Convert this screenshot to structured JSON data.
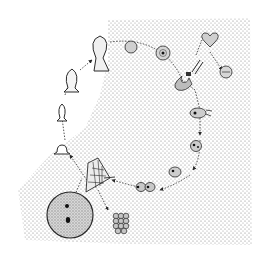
{
  "figure": {
    "type": "life-cycle illustration",
    "style": "stippled pen-and-ink",
    "colors": {
      "background": "#ffffff",
      "ink": "#2a2a2a",
      "stipple": "#7a7a7a",
      "stage_fill": "#c8c8c8"
    },
    "stages": [
      {
        "id": "large-cell",
        "label": "large round cell with granular interior and dark nuclei"
      },
      {
        "id": "cell-cluster",
        "label": "compact cluster of small cells"
      },
      {
        "id": "fan-body",
        "label": "fan-shaped reticulated body"
      },
      {
        "id": "stalk-small",
        "label": "small stalked form"
      },
      {
        "id": "stalk-medium-1",
        "label": "stalked form"
      },
      {
        "id": "stalk-medium-2",
        "label": "stalked form"
      },
      {
        "id": "stalk-large",
        "label": "large flask-shaped stalked form"
      },
      {
        "id": "round-cell-1",
        "label": "round cell"
      },
      {
        "id": "round-cell-2",
        "label": "round cell with nucleus"
      },
      {
        "id": "crescent-body",
        "label": "crescent body"
      },
      {
        "id": "heart-cell",
        "label": "heart-shaped cell"
      },
      {
        "id": "ring-cell",
        "label": "ringed cell"
      },
      {
        "id": "branching-body",
        "label": "branching body"
      },
      {
        "id": "budding-cell-1",
        "label": "budding cell"
      },
      {
        "id": "budding-cell-2",
        "label": "budding cell"
      },
      {
        "id": "paired-cells",
        "label": "paired cells"
      }
    ]
  }
}
